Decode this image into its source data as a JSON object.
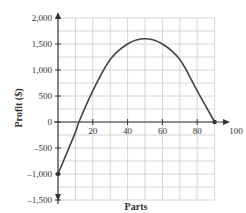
{
  "chart_data": {
    "type": "line",
    "title": "",
    "xlabel": "Parts",
    "ylabel": "Profit ($)",
    "xlim": [
      0,
      100
    ],
    "ylim": [
      -1500,
      2000
    ],
    "grid": true,
    "x_ticks": [
      "20",
      "40",
      "60",
      "80",
      "100"
    ],
    "y_ticks": [
      "2,000",
      "1,500",
      "1,000",
      "500",
      "0",
      "-500",
      "-1,000",
      "-1,500"
    ],
    "series": [
      {
        "name": "Profit",
        "x": [
          0,
          10,
          12,
          20,
          30,
          40,
          50,
          60,
          70,
          80,
          90
        ],
        "values": [
          -1000,
          -200,
          0,
          600,
          1200,
          1500,
          1600,
          1500,
          1200,
          600,
          0
        ],
        "endpoints_marked": [
          [
            0,
            -1000
          ],
          [
            90,
            0
          ]
        ]
      }
    ]
  }
}
